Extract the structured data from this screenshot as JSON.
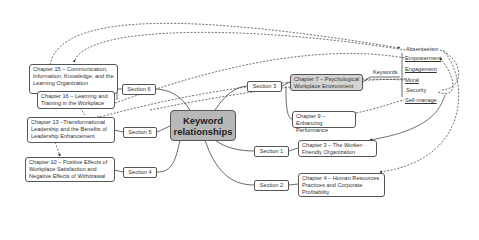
{
  "central": {
    "label_line1": "Keyword",
    "label_line2": "relationships"
  },
  "sections": {
    "s1": "Section 1",
    "s2": "Section 2",
    "s3": "Section 3",
    "s4": "Section 4",
    "s5": "Section 5",
    "s6": "Section 6"
  },
  "chapters": {
    "ch15": "Chapter 15 – Communication, Information, Knowledge, and the Learning Organization",
    "ch16": "Chapter 16 – Learning and Training in the Workplace",
    "ch13": "Chapter 13 –Transformational Leadership and the Benefits of Leadership Enhancement",
    "ch10": "Chapter 10 – Positive Effects of Workplace Satisfaction and Negative Effects of Withdrawal",
    "ch7": "Chapter 7 – Psychological Workplace Environment",
    "ch9": "Chapter 9 – Enhancing Performance",
    "ch3": "Chapter 3 – The Worker-Friendly Organization",
    "ch4": "Chapter 4 – Human Resources Practices and Corporate Profitability"
  },
  "keywords_label": "Keywords",
  "keywords": [
    "Absenteeism",
    "Empowerment",
    "Engagement",
    "Moral",
    "Security",
    "Self-manage"
  ],
  "colors": {
    "central_fill": "#b8b8b8",
    "highlight_fill": "#d4d4d4",
    "line": "#333333"
  }
}
